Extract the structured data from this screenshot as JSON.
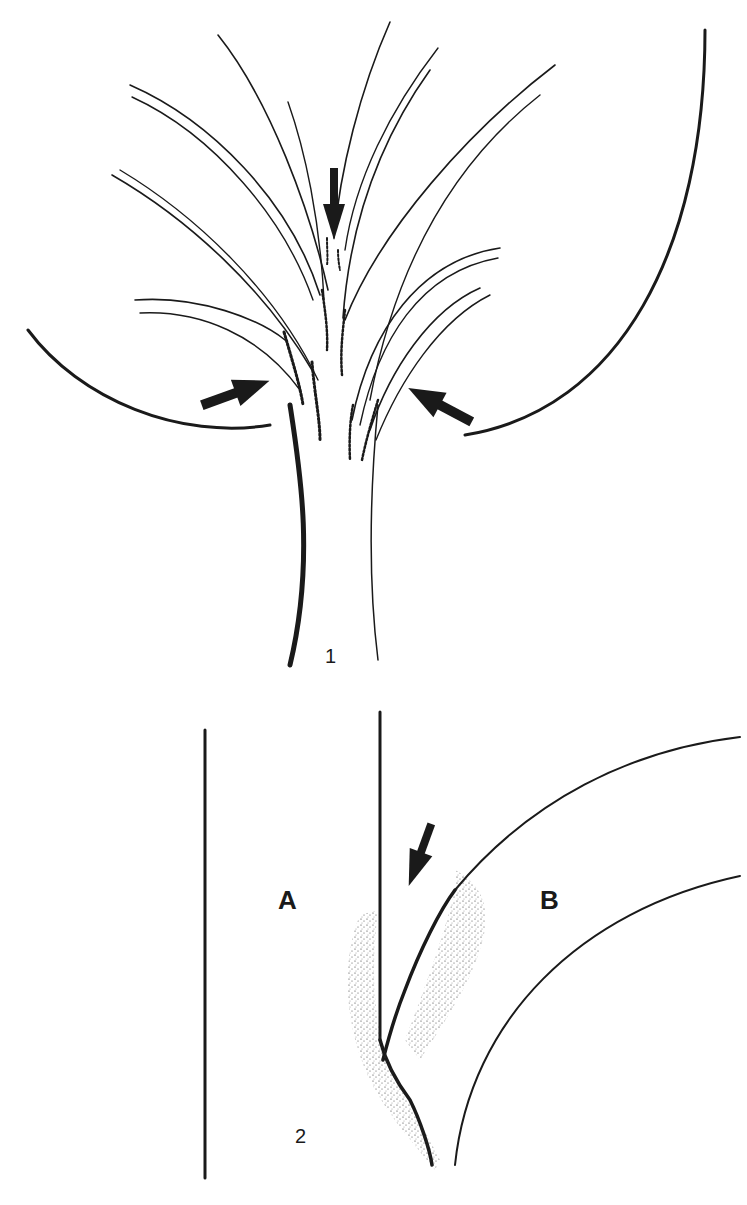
{
  "figure": {
    "panel_1": {
      "label": "1",
      "arrows": [
        "top-down-arrow",
        "left-arrow",
        "right-arrow"
      ]
    },
    "panel_2": {
      "label": "2",
      "region_a": "A",
      "region_b": "B",
      "arrows": [
        "diagonal-down-arrow"
      ]
    }
  },
  "colors": {
    "ink": "#1a1a1a",
    "background": "#ffffff"
  }
}
